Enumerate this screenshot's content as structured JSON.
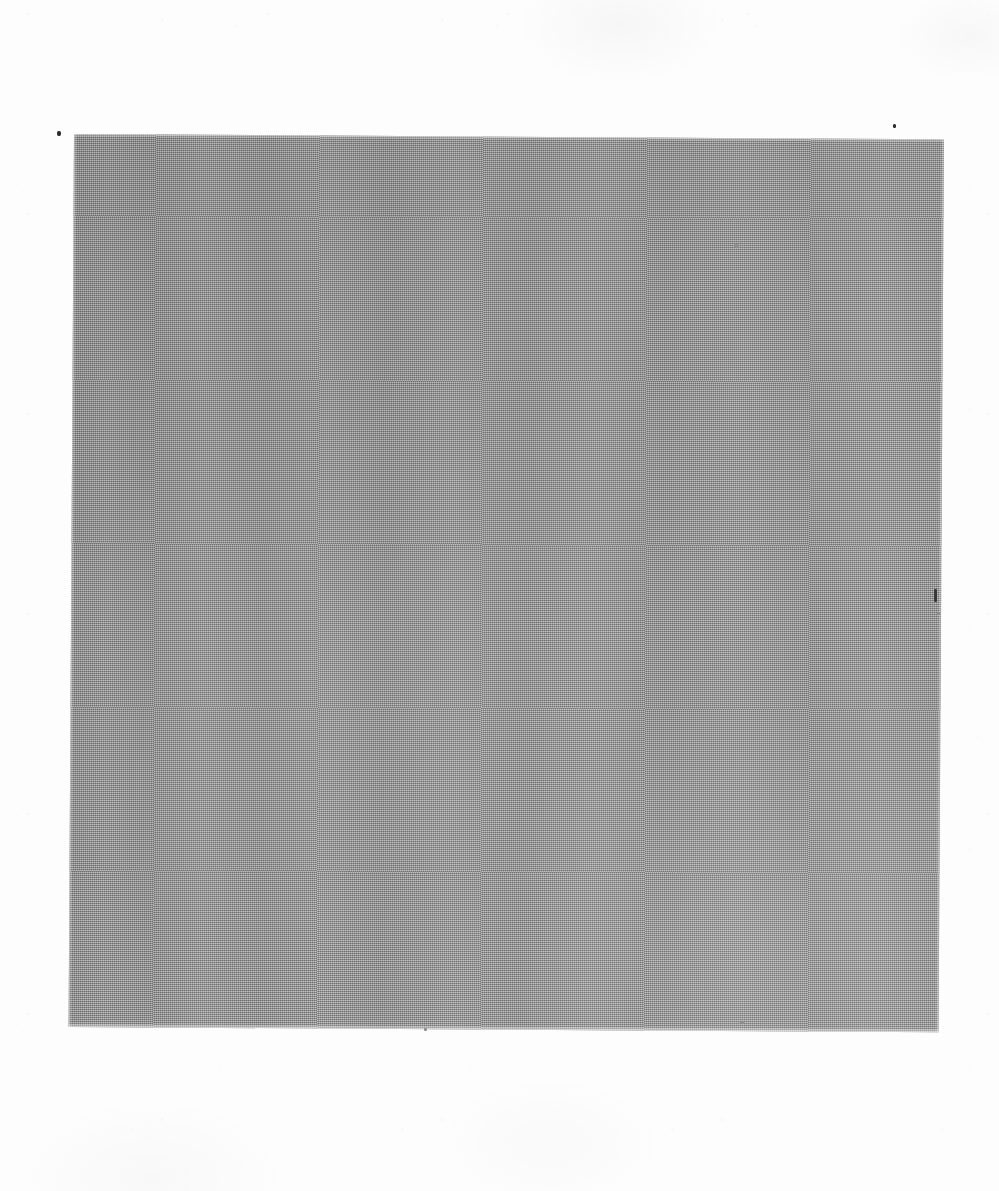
{
  "document": {
    "kind": "scanned-page",
    "page_background": "#fdfdfd",
    "width": 999,
    "height": 1191,
    "caption": "",
    "header": "",
    "footer": "",
    "page_number": ""
  },
  "plate": {
    "label": "",
    "description": "",
    "fill_color": "#9c9c9c",
    "texture": "halftone-dither",
    "left": 74,
    "top": 134,
    "width": 870,
    "height": 893,
    "rotation_deg": 0.35,
    "alt_text": ""
  },
  "artifacts": {
    "specks": [
      {
        "name": "speck-left-margin",
        "x": 57,
        "y": 131,
        "w": 4,
        "h": 5,
        "faint": false
      },
      {
        "name": "speck-top-right-margin",
        "x": 893,
        "y": 124,
        "w": 3,
        "h": 4,
        "faint": false
      },
      {
        "name": "speck-upper-right-plate",
        "x": 734,
        "y": 244,
        "w": 5,
        "h": 4,
        "faint": true
      },
      {
        "name": "speck-right-edge-mark",
        "x": 934,
        "y": 589,
        "w": 3,
        "h": 13,
        "faint": false,
        "vline": true
      },
      {
        "name": "speck-right-edge-dot",
        "x": 937,
        "y": 612,
        "w": 3,
        "h": 3,
        "faint": true
      },
      {
        "name": "speck-bottom-plate",
        "x": 740,
        "y": 1021,
        "w": 4,
        "h": 3,
        "faint": true
      },
      {
        "name": "speck-bottom-margin",
        "x": 424,
        "y": 1028,
        "w": 3,
        "h": 3,
        "faint": true
      }
    ]
  }
}
